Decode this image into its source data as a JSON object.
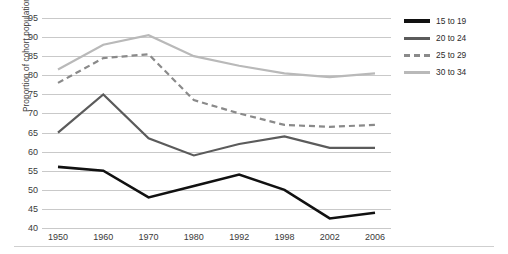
{
  "chart_data": {
    "type": "line",
    "title": "",
    "xlabel": "",
    "ylabel": "Proportion of cohort population",
    "categories": [
      "1950",
      "1960",
      "1970",
      "1980",
      "1992",
      "1998",
      "2002",
      "2006"
    ],
    "x_ticks": [
      "1950",
      "1960",
      "1970",
      "1980",
      "1992",
      "1998",
      "2002",
      "2006"
    ],
    "y_ticks": [
      40,
      45,
      50,
      55,
      60,
      65,
      70,
      75,
      80,
      85,
      90,
      95
    ],
    "ylim": [
      40,
      95
    ],
    "grid": true,
    "legend_position": "right",
    "series": [
      {
        "name": "15 to 19",
        "color": "#111111",
        "style": "solid",
        "width": 2.6,
        "values": [
          56,
          55,
          48,
          51,
          54,
          50,
          42.5,
          44
        ]
      },
      {
        "name": "20 to 24",
        "color": "#5b5b5b",
        "style": "solid",
        "width": 2.2,
        "values": [
          65,
          75,
          63.5,
          59,
          62,
          64,
          61,
          61
        ]
      },
      {
        "name": "25 to 29",
        "color": "#8a8a8a",
        "style": "dashed",
        "width": 2.2,
        "values": [
          78,
          84.5,
          85.5,
          73.5,
          70,
          67,
          66.5,
          67
        ]
      },
      {
        "name": "30 to 34",
        "color": "#b9b9b9",
        "style": "solid",
        "width": 2.2,
        "values": [
          81.5,
          88,
          90.5,
          85,
          82.5,
          80.5,
          79.5,
          80.5
        ]
      }
    ]
  },
  "legend": {
    "items": [
      {
        "label": "15 to 19"
      },
      {
        "label": "20 to 24"
      },
      {
        "label": "25 to 29"
      },
      {
        "label": "30 to 34"
      }
    ]
  }
}
